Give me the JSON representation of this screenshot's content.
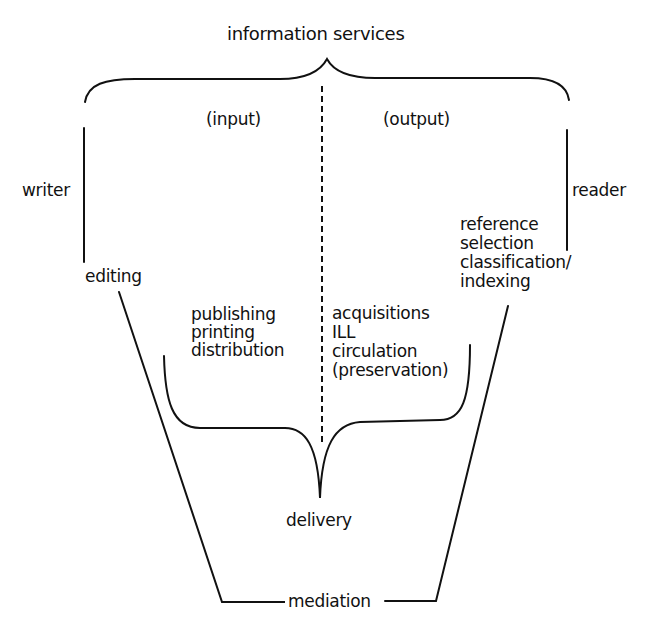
{
  "diagram": {
    "title": "information services",
    "halves": {
      "left_label": "(input)",
      "right_label": "(output)"
    },
    "actors": {
      "left": "writer",
      "right": "reader"
    },
    "left_stages": {
      "upper": "editing",
      "lower": [
        "publishing",
        "printing",
        "distribution"
      ]
    },
    "right_stages": {
      "upper": [
        "reference",
        "selection",
        "classification/",
        "indexing"
      ],
      "lower": [
        "acquisitions",
        "ILL",
        "circulation",
        "(preservation)"
      ]
    },
    "convergence": "delivery",
    "base": "mediation",
    "colors": {
      "ink": "#111111",
      "background": "#ffffff"
    }
  }
}
